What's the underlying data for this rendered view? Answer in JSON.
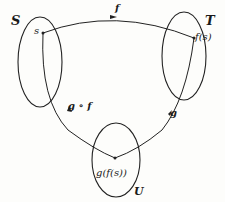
{
  "sets": {
    "S": "S",
    "T": "T",
    "U": "U"
  },
  "points": {
    "s": "s",
    "fs": "f(s)",
    "gfs": "g(f(s))"
  },
  "arrows": {
    "f": "f",
    "g": "g",
    "gof": "g ∘ f"
  },
  "colors": {
    "stroke": "#222222",
    "background": "#fdfdfb"
  }
}
